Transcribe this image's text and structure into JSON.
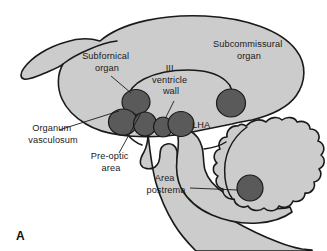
{
  "figure": {
    "panel_letter": "A",
    "caption_labels": {
      "subfornical_organ": "Subfornical\norgan",
      "subcommissural_organ": "Subcommissural\norgan",
      "third_ventricle_wall": "III\nventricle\nwall",
      "lha": "LHA",
      "organum_vasculosum": "Organum\nvasculosum",
      "pre_optic_area": "Pre-optic\narea",
      "area_postrema": "Area\npostrema"
    },
    "labels": [
      {
        "id": "subfornical-organ",
        "lines": [
          "Subfornical",
          "organ"
        ],
        "anchor": "middle",
        "x": 107,
        "y": 66
      },
      {
        "id": "subcommissural-organ",
        "lines": [
          "Subcommissural",
          "organ"
        ],
        "anchor": "middle",
        "x": 249,
        "y": 56
      },
      {
        "id": "third-ventricle-wall",
        "lines": [
          "III",
          "ventricle",
          "wall"
        ],
        "anchor": "middle",
        "x": 171,
        "y": 80
      },
      {
        "id": "lha",
        "lines": [
          "LHA"
        ],
        "anchor": "start",
        "x": 192,
        "y": 126
      },
      {
        "id": "organum-vasculosum",
        "lines": [
          "Organum",
          "vasculosum"
        ],
        "anchor": "middle",
        "x": 53,
        "y": 137
      },
      {
        "id": "pre-optic-area",
        "lines": [
          "Pre-optic",
          "area"
        ],
        "anchor": "middle",
        "x": 111,
        "y": 164
      },
      {
        "id": "area-postrema",
        "lines": [
          "Area",
          "postrema"
        ],
        "anchor": "middle",
        "x": 166,
        "y": 182
      }
    ],
    "circulumventricular_organs": [
      {
        "id": "subfornical-organ-circle",
        "cx": 136,
        "cy": 102,
        "rx": 14,
        "ry": 12.5
      },
      {
        "id": "organum-vasculosum-circle",
        "cx": 123,
        "cy": 122,
        "rx": 14.5,
        "ry": 13
      },
      {
        "id": "pre-optic-area-circle",
        "cx": 145,
        "cy": 124,
        "rx": 11.5,
        "ry": 12
      },
      {
        "id": "median-eminence-circle",
        "cx": 163,
        "cy": 127,
        "rx": 9.5,
        "ry": 10
      },
      {
        "id": "lha-circle",
        "cx": 181,
        "cy": 124,
        "rx": 13,
        "ry": 12.5
      },
      {
        "id": "subcommissural-organ-circle",
        "cx": 231,
        "cy": 103,
        "rx": 14.5,
        "ry": 14
      },
      {
        "id": "area-postrema-circle",
        "cx": 250,
        "cy": 188,
        "rx": 13,
        "ry": 13
      }
    ],
    "colors": {
      "background": "#ffffff",
      "brain_fill": "#cccccc",
      "outline": "#1a1a1a",
      "cvo_fill": "#5a5a5a",
      "text": "#1a1a1a"
    }
  }
}
